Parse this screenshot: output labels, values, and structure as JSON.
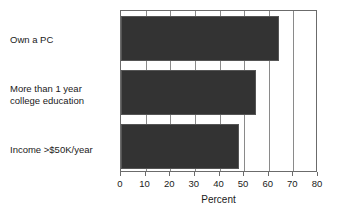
{
  "chart_data": {
    "type": "bar",
    "orientation": "horizontal",
    "title": "",
    "subtitle": "",
    "xlabel": "Percent",
    "ylabel": "",
    "categories": [
      "Own a PC",
      "More than 1 year\ncollege education",
      "Income >$50K/year"
    ],
    "values": [
      64,
      55,
      48
    ],
    "series": [
      {
        "name": "Percent",
        "values": [
          64,
          55,
          48
        ]
      }
    ],
    "xlim": [
      0,
      80
    ],
    "xticks": [
      0,
      10,
      20,
      30,
      40,
      50,
      60,
      70,
      80
    ],
    "xtick_labels": [
      "0",
      "10",
      "20",
      "30",
      "40",
      "50",
      "60",
      "70",
      "80"
    ],
    "grid": true,
    "grid_axis": "x",
    "legend": false,
    "legend_position": "none",
    "bar_color": "#333333",
    "bar_edge_color": "#555555",
    "axis_color": "#6b6b6b",
    "grid_color": "#8a8a8a",
    "background_color": "#ffffff",
    "text_color": "#1a1a1a"
  }
}
